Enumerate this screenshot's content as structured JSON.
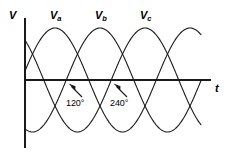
{
  "figure": {
    "title": "",
    "background_color": "#ffffff",
    "line_color": "#1a1a1a",
    "axis_color": "#1a1a1a",
    "width": 227,
    "height": 153
  },
  "axes": {
    "y_axis_label": "V",
    "x_axis_label": "t",
    "y_axis_x_px": 25,
    "y_axis_top_px": 18,
    "y_axis_bottom_px": 148,
    "x_axis_y_px": 80,
    "x_axis_left_px": 25,
    "x_axis_right_px": 211
  },
  "series_labels": [
    {
      "name": "va-label",
      "base": "V",
      "sub": "a",
      "x_px": 50,
      "y_px": 10
    },
    {
      "name": "vb-label",
      "base": "V",
      "sub": "b",
      "x_px": 95,
      "y_px": 10
    },
    {
      "name": "vc-label",
      "base": "V",
      "sub": "c",
      "x_px": 140,
      "y_px": 10
    }
  ],
  "annotations": [
    {
      "name": "phase-120",
      "text": "120°",
      "x_px": 66,
      "y_px": 99,
      "arrow_from_x": 82,
      "arrow_from_y": 97,
      "arrow_to_x": 70,
      "arrow_to_y": 85
    },
    {
      "name": "phase-240",
      "text": "240°",
      "x_px": 110,
      "y_px": 99,
      "arrow_from_x": 127,
      "arrow_from_y": 97,
      "arrow_to_x": 115,
      "arrow_to_y": 85
    }
  ],
  "chart_data": {
    "type": "line",
    "title": "",
    "xlabel": "t",
    "ylabel": "V",
    "grid": false,
    "legend": "inline-curve-labels",
    "xlim": [
      0,
      540
    ],
    "ylim": [
      -1,
      1
    ],
    "x_unit": "degrees",
    "period_degrees": 360,
    "amplitude": 1,
    "series": [
      {
        "name": "Va",
        "label": "V_a",
        "phase_deg": 0,
        "formula": "sin(theta)",
        "color": "#1a1a1a"
      },
      {
        "name": "Vb",
        "label": "V_b",
        "phase_deg": -120,
        "formula": "sin(theta - 120)",
        "color": "#1a1a1a"
      },
      {
        "name": "Vc",
        "label": "V_c",
        "phase_deg": -240,
        "formula": "sin(theta - 240)",
        "color": "#1a1a1a"
      }
    ],
    "annotations": [
      "120°",
      "240°"
    ]
  },
  "geometry": {
    "peak_y_px": 28,
    "trough_y_px": 132,
    "midline_y_px": 80,
    "period_px": 135,
    "phase_offset_px": 45,
    "curve_start_x_px": 25,
    "curve_end_x_px": 201,
    "va_first_peak_x_px": 55,
    "vb_first_peak_x_px": 100,
    "vc_first_peak_x_px": 145
  }
}
